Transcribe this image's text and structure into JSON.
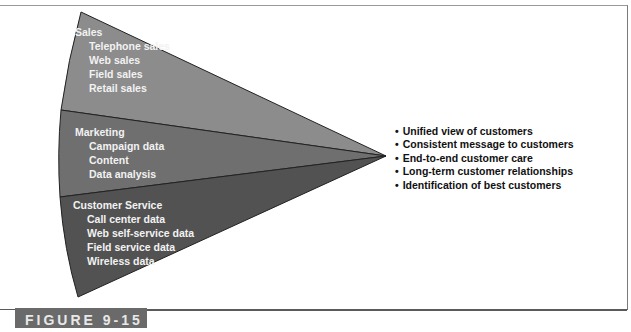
{
  "diagram": {
    "type": "converging-fan",
    "colors": {
      "sales": "#8c8c8c",
      "marketing": "#6f6f6f",
      "customer_service": "#525252",
      "text_on_fan": "#f2f2f2",
      "bullet_text": "#111111",
      "label_bg": "#6a6a6a"
    },
    "segments": [
      {
        "title": "Sales",
        "items": [
          "Telephone sales",
          "Web sales",
          "Field sales",
          "Retail sales"
        ]
      },
      {
        "title": "Marketing",
        "items": [
          "Campaign data",
          "Content",
          "Data analysis"
        ]
      },
      {
        "title": "Customer Service",
        "items": [
          "Call center data",
          "Web self-service data",
          "Field service data",
          "Wireless data"
        ]
      }
    ],
    "benefits": [
      "Unified view of customers",
      "Consistent message to customers",
      "End-to-end customer care",
      "Long-term customer relationships",
      "Identification of best customers"
    ],
    "figure_label": "FIGURE 9-15"
  }
}
